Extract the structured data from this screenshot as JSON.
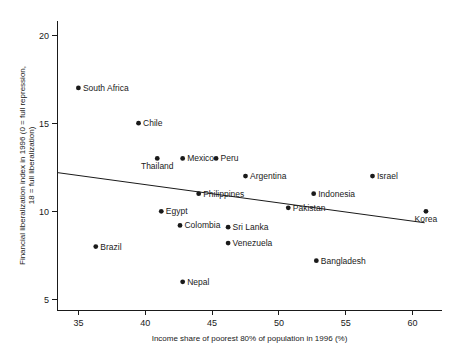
{
  "chart_data": {
    "type": "scatter",
    "title": "",
    "xlabel": "Income share of poorest 80% of population in 1996 (%)",
    "ylabel": "Financial liberalization index in 1996 (0 = full repression, 18 = full liberalization)",
    "ylabel_line1": "Financial liberalization index in 1996 (0 = full repression,",
    "ylabel_line2": "18 = full liberalization)",
    "xlim": [
      33.4,
      62.2
    ],
    "ylim": [
      4.4,
      20.8
    ],
    "xticks": [
      35,
      40,
      45,
      50,
      55,
      60
    ],
    "yticks": [
      5,
      10,
      15,
      20
    ],
    "xtick_labels": [
      "35",
      "40",
      "45",
      "50",
      "55",
      "60"
    ],
    "ytick_labels": [
      "5",
      "10",
      "15",
      "20"
    ],
    "grid": false,
    "legend": "none",
    "points": [
      {
        "label": "South Africa",
        "x": 35.0,
        "y": 17.0,
        "label_pos": "right"
      },
      {
        "label": "Chile",
        "x": 39.5,
        "y": 15.0,
        "label_pos": "right"
      },
      {
        "label": "Thailand",
        "x": 40.9,
        "y": 13.0,
        "label_pos": "below"
      },
      {
        "label": "Mexico",
        "x": 42.8,
        "y": 13.0,
        "label_pos": "right"
      },
      {
        "label": "Peru",
        "x": 45.3,
        "y": 13.0,
        "label_pos": "right"
      },
      {
        "label": "Argentina",
        "x": 47.5,
        "y": 12.0,
        "label_pos": "right"
      },
      {
        "label": "Israel",
        "x": 57.0,
        "y": 12.0,
        "label_pos": "right"
      },
      {
        "label": "Philippines",
        "x": 44.0,
        "y": 11.0,
        "label_pos": "right"
      },
      {
        "label": "Indonesia",
        "x": 52.6,
        "y": 11.0,
        "label_pos": "right"
      },
      {
        "label": "Korea",
        "x": 61.0,
        "y": 10.0,
        "label_pos": "below"
      },
      {
        "label": "Egypt",
        "x": 41.2,
        "y": 10.0,
        "label_pos": "right"
      },
      {
        "label": "Pakistan",
        "x": 50.7,
        "y": 10.2,
        "label_pos": "right"
      },
      {
        "label": "Colombia",
        "x": 42.6,
        "y": 9.2,
        "label_pos": "right"
      },
      {
        "label": "Sri Lanka",
        "x": 46.2,
        "y": 9.1,
        "label_pos": "right"
      },
      {
        "label": "Brazil",
        "x": 36.3,
        "y": 8.0,
        "label_pos": "right"
      },
      {
        "label": "Venezuela",
        "x": 46.2,
        "y": 8.2,
        "label_pos": "right"
      },
      {
        "label": "Bangladesh",
        "x": 52.8,
        "y": 7.2,
        "label_pos": "right"
      },
      {
        "label": "Nepal",
        "x": 42.8,
        "y": 6.0,
        "label_pos": "right"
      }
    ],
    "trend_line": {
      "x0": 33.4,
      "y0": 12.2,
      "x1": 60.9,
      "y1": 9.35
    }
  }
}
